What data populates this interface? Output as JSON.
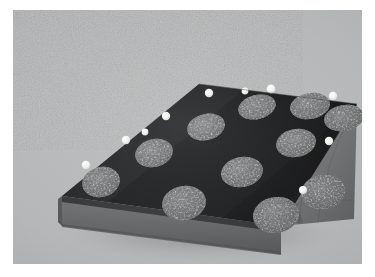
{
  "image": {
    "title": "Inclined wedge ramp with circular targets",
    "medium": "grayscale photograph",
    "subject": "three-dimensional wedge-shaped ramp block",
    "background_color": "#b3b4b5",
    "border_color": "#ffffff",
    "plate": {
      "x": 13,
      "y": 10,
      "width": 349,
      "height": 254
    }
  },
  "colors": {
    "background": "#b3b4b5",
    "ramp_top_dark": "#0d0d0f",
    "ramp_top_dark_lower": "#131315",
    "front_slab_face": "#5c5d5e",
    "front_slab_top_lip": "#2a2b2c",
    "side_wedge_face": "#6e6f70",
    "side_wedge_shadow": "#525354",
    "spot_gray": "#6a6b6c",
    "spot_gray_light": "#7b7c7d",
    "marker_white": "#f2f2f0",
    "contour_line": "#4b4c4d",
    "cast_shadow": "#9a9b9c"
  },
  "geometry": {
    "description": "A wedge (ramp) block viewed in three-quarter perspective. A dark matte inclined plane rises from the lower-left front edge toward the upper-right ridge. A light gray rectangular base slab forms the front face, and a gray triangular wedge face closes the right end.",
    "ramp_top_polygon": "low-front-left, high-back-ridge-left, high-back-ridge-right, low-front-right",
    "ridge_edge": "upper right, nearly horizontal",
    "front_slab": "rectangular band across the lower front",
    "side_face": "triangular wedge on the right bearing nested arc contour lines"
  },
  "targets": {
    "label": "elliptical gray spots on inclined surface",
    "count": 11,
    "shape": "ellipse",
    "fill": "#6a6b6c",
    "rows": [
      {
        "row": 1,
        "count": 4
      },
      {
        "row": 2,
        "count": 4
      },
      {
        "row": 3,
        "count": 3
      }
    ],
    "items": [
      {
        "id": "spot-1",
        "cx": 88,
        "cy": 172,
        "rx": 19,
        "ry": 15,
        "rot": -14
      },
      {
        "id": "spot-2",
        "cx": 141,
        "cy": 143,
        "rx": 19,
        "ry": 14,
        "rot": -14
      },
      {
        "id": "spot-3",
        "cx": 193,
        "cy": 117,
        "rx": 19,
        "ry": 13,
        "rot": -14
      },
      {
        "id": "spot-4",
        "cx": 244,
        "cy": 97,
        "rx": 19,
        "ry": 12,
        "rot": -14
      },
      {
        "id": "spot-5",
        "cx": 171,
        "cy": 193,
        "rx": 22,
        "ry": 17,
        "rot": -10
      },
      {
        "id": "spot-6",
        "cx": 229,
        "cy": 162,
        "rx": 21,
        "ry": 15,
        "rot": -10
      },
      {
        "id": "spot-7",
        "cx": 283,
        "cy": 133,
        "rx": 20,
        "ry": 14,
        "rot": -10
      },
      {
        "id": "spot-8",
        "cx": 331,
        "cy": 108,
        "rx": 20,
        "ry": 13,
        "rot": -10
      },
      {
        "id": "spot-9",
        "cx": 263,
        "cy": 205,
        "rx": 23,
        "ry": 18,
        "rot": -8
      },
      {
        "id": "spot-10",
        "cx": 310,
        "cy": 182,
        "rx": 22,
        "ry": 17,
        "rot": -8
      },
      {
        "id": "spot-11",
        "cx": 297,
        "cy": 96,
        "rx": 20,
        "ry": 13,
        "rot": -10
      }
    ]
  },
  "markers": {
    "label": "small white spherical reference markers",
    "count": 10,
    "fill": "#f2f2f0",
    "items": [
      {
        "id": "marker-1",
        "cx": 73,
        "cy": 155,
        "r": 4.2,
        "edge": "left-slope"
      },
      {
        "id": "marker-2",
        "cx": 113,
        "cy": 130,
        "r": 4.2,
        "edge": "left-slope"
      },
      {
        "id": "marker-3",
        "cx": 153,
        "cy": 106,
        "r": 4.2,
        "edge": "left-slope"
      },
      {
        "id": "marker-4",
        "cx": 196,
        "cy": 83,
        "r": 4.2,
        "edge": "ridge"
      },
      {
        "id": "marker-5",
        "cx": 258,
        "cy": 79,
        "r": 4.4,
        "edge": "ridge"
      },
      {
        "id": "marker-6",
        "cx": 320,
        "cy": 86,
        "r": 4.2,
        "edge": "ridge-right"
      },
      {
        "id": "marker-7",
        "cx": 316,
        "cy": 131,
        "r": 4.2,
        "edge": "right-slope"
      },
      {
        "id": "marker-8",
        "cx": 290,
        "cy": 180,
        "r": 4.0,
        "edge": "right-slope"
      },
      {
        "id": "marker-9",
        "cx": 132,
        "cy": 122,
        "r": 3.4,
        "edge": "left-slope"
      },
      {
        "id": "marker-10",
        "cx": 232,
        "cy": 81,
        "r": 3.4,
        "edge": "ridge"
      }
    ]
  },
  "contours": {
    "label": "nested arc contour lines on right wedge face",
    "count": 4,
    "stroke": "#474849"
  }
}
